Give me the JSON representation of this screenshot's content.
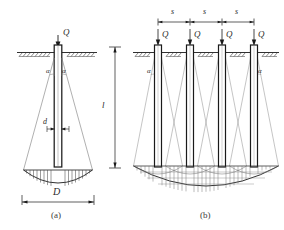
{
  "figure": {
    "type": "geotechnical-diagram",
    "background_color": "#ffffff",
    "line_color": "#1a1a1a",
    "thin_line_color": "#6b6b6b",
    "label_color": "#2a2a2a"
  },
  "panel_a": {
    "caption": "(a)",
    "load_label": "Q",
    "angle_label_left": "α",
    "angle_label_right": "α",
    "pile_width_label": "d",
    "spread_width_label": "D",
    "pile_length_label": "l",
    "pile_count": 1
  },
  "panel_b": {
    "caption": "(b)",
    "load_labels": [
      "Q",
      "Q",
      "Q",
      "Q"
    ],
    "spacing_labels": [
      "s",
      "s",
      "s"
    ],
    "angle_label_left": "α",
    "angle_label_right": "α",
    "pile_count": 4
  }
}
